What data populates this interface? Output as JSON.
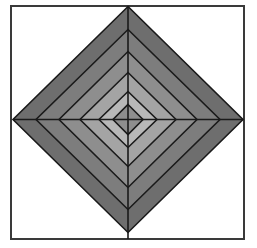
{
  "figure": {
    "title": "Nested concentric diamonds",
    "type": "geometric-diagram",
    "canvas": {
      "width": 257,
      "height": 248,
      "background_color": "#ffffff"
    },
    "frame": {
      "label": "Square border frame",
      "x": 11,
      "y": 6,
      "width": 233,
      "height": 233,
      "stroke_color": "#3a3a3a",
      "stroke_width": 2,
      "fill_color": "#ffffff"
    },
    "center": {
      "x": 128,
      "y": 119.5
    },
    "outline_color": "#1a1a1a",
    "outline_width": 1.6,
    "axis_lines": {
      "label": "Center cross axes",
      "color": "#1a1a1a",
      "width": 1.6,
      "horizontal": {
        "x1": 13,
        "y1": 119.5,
        "x2": 243,
        "y2": 119.5
      },
      "vertical": {
        "x1": 128,
        "y1": 6,
        "x2": 128,
        "y2": 239
      }
    },
    "diamonds": [
      {
        "name": "diamond-ring-1-outer",
        "index": 1,
        "half_width": 115,
        "half_height": 113,
        "fill_color": "#6e6e6e",
        "shade_label": "dark gray"
      },
      {
        "name": "diamond-ring-2",
        "index": 2,
        "half_width": 92,
        "half_height": 90,
        "fill_color": "#7d7d7d",
        "shade_label": "dark-medium gray"
      },
      {
        "name": "diamond-ring-3",
        "index": 3,
        "half_width": 69,
        "half_height": 68,
        "fill_color": "#8e8e8e",
        "shade_label": "medium gray"
      },
      {
        "name": "diamond-ring-4",
        "index": 4,
        "half_width": 48,
        "half_height": 47,
        "fill_color": "#a4a4a4",
        "shade_label": "light-medium gray"
      },
      {
        "name": "diamond-ring-5",
        "index": 5,
        "half_width": 29,
        "half_height": 28,
        "fill_color": "#b8b8b8",
        "shade_label": "light gray"
      },
      {
        "name": "diamond-core",
        "index": 6,
        "half_width": 15,
        "half_height": 15,
        "fill_color": "#8e8e8e",
        "shade_label": "medium gray core"
      }
    ]
  }
}
